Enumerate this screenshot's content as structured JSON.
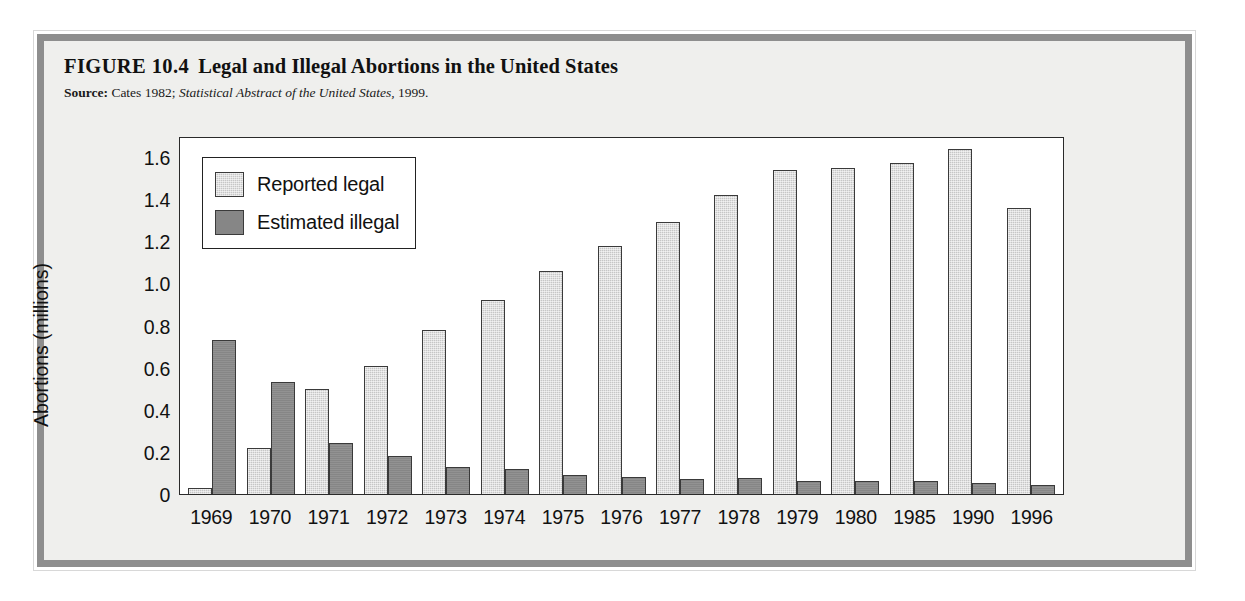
{
  "figure": {
    "number_label": "FIGURE 10.4",
    "title": "Legal and Illegal Abortions in the United States",
    "source_label": "Source:",
    "source_part1": "Cates 1982;",
    "source_italic": "Statistical Abstract of the United States,",
    "source_year": "1999."
  },
  "colors": {
    "frame_gray": "#8e8e8e",
    "panel_bg": "#efefed",
    "legal_bar": "#c6c6c6",
    "illegal_bar": "#868686",
    "axis": "#2a2a2a"
  },
  "chart_data": {
    "type": "bar",
    "title": "Legal and Illegal Abortions in the United States",
    "xlabel": "",
    "ylabel": "Abortions (millions)",
    "ylim": [
      0,
      1.7
    ],
    "ytick_values": [
      0,
      0.2,
      0.4,
      0.6,
      0.8,
      1.0,
      1.2,
      1.4,
      1.6
    ],
    "ytick_labels": [
      "0",
      "0.2",
      "0.4",
      "0.6",
      "0.8",
      "1.0",
      "1.2",
      "1.4",
      "1.6"
    ],
    "grid": false,
    "legend_position": "upper left",
    "categories": [
      "1969",
      "1970",
      "1971",
      "1972",
      "1973",
      "1974",
      "1975",
      "1976",
      "1977",
      "1978",
      "1979",
      "1980",
      "1985",
      "1990",
      "1996"
    ],
    "series": [
      {
        "name": "Reported legal",
        "color": "#c6c6c6",
        "values": [
          0.03,
          0.22,
          0.5,
          0.61,
          0.78,
          0.92,
          1.06,
          1.18,
          1.29,
          1.42,
          1.54,
          1.55,
          1.57,
          1.64,
          1.36
        ]
      },
      {
        "name": "Estimated illegal",
        "color": "#868686",
        "values": [
          0.73,
          0.53,
          0.24,
          0.18,
          0.13,
          0.12,
          0.09,
          0.08,
          0.07,
          0.075,
          0.06,
          0.06,
          0.06,
          0.05,
          0.045
        ]
      }
    ]
  }
}
